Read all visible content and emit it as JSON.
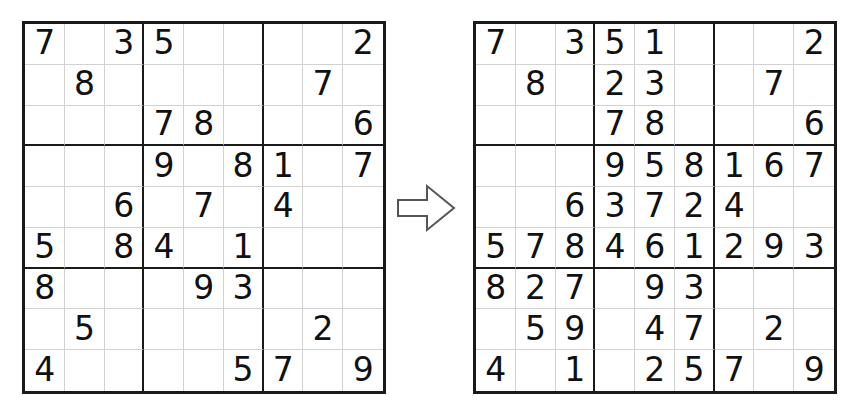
{
  "page": {
    "background_color": "#ffffff",
    "digit_color": "#111111",
    "grid_line_color": "#d2d2d2",
    "box_line_color": "#1a1a1a"
  },
  "arrow": {
    "name": "transforms-into-arrow",
    "direction": "right",
    "label": "=>",
    "stroke_color": "#555555",
    "fill_color": "#ffffff"
  },
  "grids": [
    {
      "id": "puzzle",
      "role": "initial-puzzle",
      "rows": [
        [
          "7",
          "",
          "3",
          "5",
          "",
          "",
          "",
          "",
          "2"
        ],
        [
          "",
          "8",
          "",
          "",
          "",
          "",
          "",
          "7",
          ""
        ],
        [
          "",
          "",
          "",
          "7",
          "8",
          "",
          "",
          "",
          "6"
        ],
        [
          "",
          "",
          "",
          "9",
          "",
          "8",
          "1",
          "",
          "7"
        ],
        [
          "",
          "",
          "6",
          "",
          "7",
          "",
          "4",
          "",
          ""
        ],
        [
          "5",
          "",
          "8",
          "4",
          "",
          "1",
          "",
          "",
          ""
        ],
        [
          "8",
          "",
          "",
          "",
          "9",
          "3",
          "",
          "",
          ""
        ],
        [
          "",
          "5",
          "",
          "",
          "",
          "",
          "",
          "2",
          ""
        ],
        [
          "4",
          "",
          "",
          "",
          "",
          "5",
          "7",
          "",
          "9"
        ]
      ]
    },
    {
      "id": "solution",
      "role": "partially-solved-puzzle",
      "rows": [
        [
          "7",
          "",
          "3",
          "5",
          "1",
          "",
          "",
          "",
          "2"
        ],
        [
          "",
          "8",
          "",
          "2",
          "3",
          "",
          "",
          "7",
          ""
        ],
        [
          "",
          "",
          "",
          "7",
          "8",
          "",
          "",
          "",
          "6"
        ],
        [
          "",
          "",
          "",
          "9",
          "5",
          "8",
          "1",
          "6",
          "7"
        ],
        [
          "",
          "",
          "6",
          "3",
          "7",
          "2",
          "4",
          "",
          ""
        ],
        [
          "5",
          "7",
          "8",
          "4",
          "6",
          "1",
          "2",
          "9",
          "3"
        ],
        [
          "8",
          "2",
          "7",
          "",
          "9",
          "3",
          "",
          "",
          ""
        ],
        [
          "",
          "5",
          "9",
          "",
          "4",
          "7",
          "",
          "2",
          ""
        ],
        [
          "4",
          "",
          "1",
          "",
          "2",
          "5",
          "7",
          "",
          "9"
        ]
      ]
    }
  ]
}
